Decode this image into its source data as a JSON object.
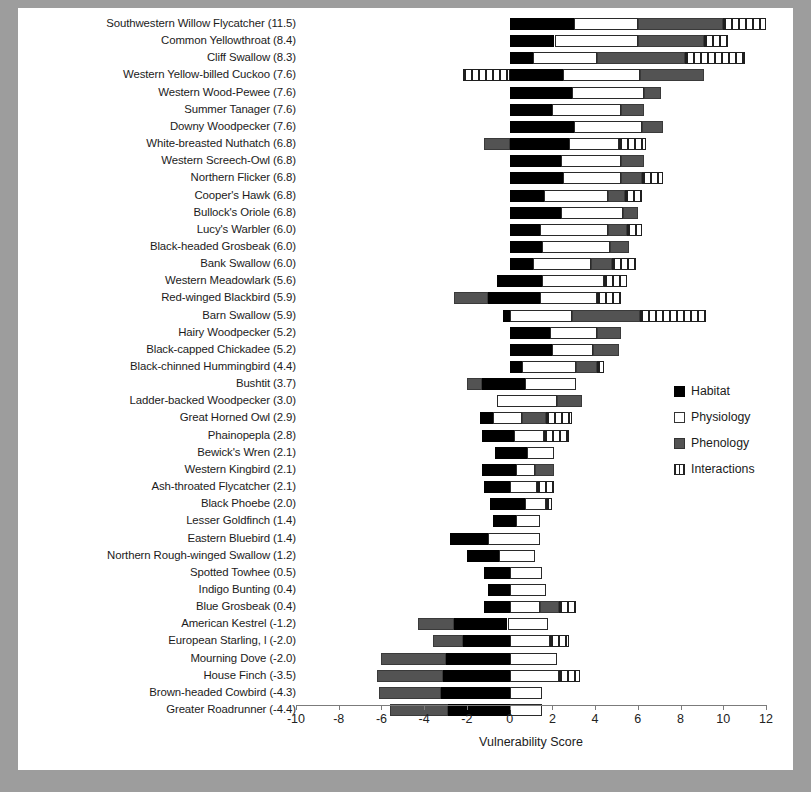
{
  "chart_data": {
    "type": "bar",
    "orientation": "horizontal",
    "stacked": true,
    "title": "",
    "xlabel": "Vulnerability Score",
    "ylabel": "",
    "xlim": [
      -10,
      12
    ],
    "xticks": [
      -10,
      -8,
      -6,
      -4,
      -2,
      0,
      2,
      4,
      6,
      8,
      10,
      12
    ],
    "xticklabels": [
      "-10",
      "-8",
      "-6",
      "-4",
      "-2",
      "0",
      "2",
      "4",
      "6",
      "8",
      "10",
      "12"
    ],
    "grid": false,
    "legend_position": "right",
    "legend": [
      {
        "name": "Habitat",
        "fill": "#000000",
        "style": "solid-black"
      },
      {
        "name": "Physiology",
        "fill": "#ffffff",
        "style": "open-white"
      },
      {
        "name": "Phenology",
        "fill": "#535353",
        "style": "solid-gray"
      },
      {
        "name": "Interactions",
        "fill": "#ffffff",
        "style": "vertical-hatch"
      }
    ],
    "series_order": [
      "Habitat",
      "Physiology",
      "Phenology",
      "Interactions"
    ],
    "categories": [
      "Southwestern Willow Flycatcher (11.5)",
      "Common Yellowthroat  (8.4)",
      "Cliff Swallow  (8.3)",
      "Western Yellow-billed Cuckoo  (7.6)",
      "Western Wood-Pewee  (7.6)",
      "Summer Tanager  (7.6)",
      "Downy Woodpecker  (7.6)",
      "White-breasted Nuthatch  (6.8)",
      "Western Screech-Owl  (6.8)",
      "Northern Flicker  (6.8)",
      "Cooper's Hawk  (6.8)",
      "Bullock's Oriole (6.8)",
      "Lucy's Warbler  (6.0)",
      "Black-headed Grosbeak  (6.0)",
      "Bank Swallow (6.0)",
      "Western Meadowlark (5.6)",
      "Red-winged Blackbird (5.9)",
      "Barn Swallow (5.9)",
      "Hairy Woodpecker (5.2)",
      "Black-capped Chickadee (5.2)",
      "Black-chinned Hummingbird (4.4)",
      "Bushtit (3.7)",
      "Ladder-backed Woodpecker (3.0)",
      "Great Horned Owl (2.9)",
      "Phainopepla (2.8)",
      "Bewick's Wren  (2.1)",
      "Western Kingbird  (2.1)",
      "Ash-throated Flycatcher (2.1)",
      "Black Phoebe (2.0)",
      "Lesser Goldfinch  (1.4)",
      "Eastern Bluebird (1.4)",
      "Northern Rough-winged Swallow (1.2)",
      "Spotted Towhee (0.5)",
      "Indigo Bunting  (0.4)",
      "Blue Grosbeak (0.4)",
      "American Kestrel (-1.2)",
      "European Starling, l (-2.0)",
      "Mourning Dove (-2.0)",
      "House Finch (-3.5)",
      "Brown-headed Cowbird (-4.3)",
      "Greater Roadrunner (-4.4)"
    ],
    "scores": [
      11.5,
      8.4,
      8.3,
      7.6,
      7.6,
      7.6,
      7.6,
      6.8,
      6.8,
      6.8,
      6.8,
      6.8,
      6.0,
      6.0,
      6.0,
      5.6,
      5.9,
      5.9,
      5.2,
      5.2,
      4.4,
      3.7,
      3.0,
      2.9,
      2.8,
      2.1,
      2.1,
      2.1,
      2.0,
      1.4,
      1.4,
      1.2,
      0.5,
      0.4,
      0.4,
      -1.2,
      -2.0,
      -2.0,
      -3.5,
      -4.3,
      -4.4
    ],
    "rows": [
      {
        "habitat": [
          0.0,
          3.0
        ],
        "physiology": [
          3.0,
          6.0
        ],
        "phenology": [
          6.0,
          10.0
        ],
        "interactions": [
          10.0,
          12.0
        ]
      },
      {
        "habitat": [
          0.0,
          2.1
        ],
        "physiology": [
          2.1,
          6.0
        ],
        "phenology": [
          6.0,
          9.1
        ],
        "interactions": [
          9.1,
          10.2
        ]
      },
      {
        "habitat": [
          0.0,
          1.1
        ],
        "physiology": [
          1.1,
          4.1
        ],
        "phenology": [
          4.1,
          8.2
        ],
        "interactions": [
          8.2,
          11.0
        ]
      },
      {
        "habitat": [
          0.0,
          2.5
        ],
        "physiology": [
          2.5,
          6.1
        ],
        "phenology": [
          6.1,
          9.1
        ],
        "interactions": [
          -2.2,
          0.0
        ]
      },
      {
        "habitat": [
          0.0,
          2.9
        ],
        "physiology": [
          2.9,
          6.3
        ],
        "phenology": [
          6.3,
          7.1
        ],
        "interactions": [
          7.1,
          7.1
        ]
      },
      {
        "habitat": [
          0.0,
          2.0
        ],
        "physiology": [
          2.0,
          5.2
        ],
        "phenology": [
          5.2,
          6.3
        ],
        "interactions": [
          6.3,
          6.3
        ]
      },
      {
        "habitat": [
          0.0,
          3.0
        ],
        "physiology": [
          3.0,
          6.2
        ],
        "phenology": [
          6.2,
          7.2
        ],
        "interactions": [
          7.2,
          7.2
        ]
      },
      {
        "habitat": [
          0.0,
          2.8
        ],
        "physiology": [
          2.8,
          5.1
        ],
        "phenology": [
          -1.2,
          0.0
        ],
        "interactions": [
          5.1,
          6.4
        ]
      },
      {
        "habitat": [
          0.0,
          2.4
        ],
        "physiology": [
          2.4,
          5.2
        ],
        "phenology": [
          5.2,
          6.3
        ],
        "interactions": [
          6.3,
          6.3
        ]
      },
      {
        "habitat": [
          0.0,
          2.5
        ],
        "physiology": [
          2.5,
          5.2
        ],
        "phenology": [
          5.2,
          6.2
        ],
        "interactions": [
          6.2,
          7.2
        ]
      },
      {
        "habitat": [
          0.0,
          1.6
        ],
        "physiology": [
          1.6,
          4.6
        ],
        "phenology": [
          4.6,
          5.4
        ],
        "interactions": [
          5.4,
          6.2
        ]
      },
      {
        "habitat": [
          0.0,
          2.4
        ],
        "physiology": [
          2.4,
          5.3
        ],
        "phenology": [
          5.3,
          6.0
        ],
        "interactions": [
          6.0,
          6.0
        ]
      },
      {
        "habitat": [
          0.0,
          1.4
        ],
        "physiology": [
          1.4,
          4.6
        ],
        "phenology": [
          4.6,
          5.5
        ],
        "interactions": [
          5.5,
          6.2
        ]
      },
      {
        "habitat": [
          0.0,
          1.5
        ],
        "physiology": [
          1.5,
          4.7
        ],
        "phenology": [
          4.7,
          5.6
        ],
        "interactions": [
          5.6,
          5.6
        ]
      },
      {
        "habitat": [
          0.0,
          1.1
        ],
        "physiology": [
          1.1,
          3.8
        ],
        "phenology": [
          3.8,
          4.8
        ],
        "interactions": [
          4.8,
          5.9
        ]
      },
      {
        "habitat": [
          -0.6,
          1.5
        ],
        "physiology": [
          1.5,
          4.4
        ],
        "phenology": [
          -0.6,
          -0.6
        ],
        "interactions": [
          4.4,
          5.5
        ]
      },
      {
        "habitat": [
          -1.0,
          1.4
        ],
        "physiology": [
          1.4,
          4.1
        ],
        "phenology": [
          -2.6,
          -1.0
        ],
        "interactions": [
          4.1,
          5.2
        ]
      },
      {
        "habitat": [
          -0.3,
          0.0
        ],
        "physiology": [
          0.0,
          2.9
        ],
        "phenology": [
          2.9,
          6.1
        ],
        "interactions": [
          6.1,
          9.2
        ]
      },
      {
        "habitat": [
          0.0,
          1.9
        ],
        "physiology": [
          1.9,
          4.1
        ],
        "phenology": [
          4.1,
          5.2
        ],
        "interactions": [
          5.2,
          5.2
        ]
      },
      {
        "habitat": [
          0.0,
          2.0
        ],
        "physiology": [
          2.0,
          3.9
        ],
        "phenology": [
          3.9,
          5.1
        ],
        "interactions": [
          5.1,
          5.1
        ]
      },
      {
        "habitat": [
          0.0,
          0.6
        ],
        "physiology": [
          0.6,
          3.1
        ],
        "phenology": [
          3.1,
          4.1
        ],
        "interactions": [
          4.1,
          4.4
        ]
      },
      {
        "habitat": [
          -1.3,
          0.7
        ],
        "physiology": [
          0.7,
          3.1
        ],
        "phenology": [
          -2.0,
          -1.3
        ],
        "interactions": [
          3.1,
          3.1
        ]
      },
      {
        "habitat": [
          0.0,
          0.0
        ],
        "physiology": [
          -0.6,
          2.2
        ],
        "phenology": [
          2.2,
          3.4
        ],
        "interactions": [
          3.4,
          3.4
        ]
      },
      {
        "habitat": [
          -1.4,
          -0.8
        ],
        "physiology": [
          -0.8,
          0.6
        ],
        "phenology": [
          0.6,
          1.7
        ],
        "interactions": [
          1.7,
          2.9
        ]
      },
      {
        "habitat": [
          -1.3,
          0.2
        ],
        "physiology": [
          0.2,
          1.6
        ],
        "phenology": [
          -1.3,
          -1.3
        ],
        "interactions": [
          1.6,
          2.8
        ]
      },
      {
        "habitat": [
          -0.7,
          0.8
        ],
        "physiology": [
          0.8,
          2.1
        ],
        "phenology": [
          -0.7,
          -0.7
        ],
        "interactions": [
          2.1,
          2.1
        ]
      },
      {
        "habitat": [
          -1.3,
          0.3
        ],
        "physiology": [
          0.3,
          1.2
        ],
        "phenology": [
          1.2,
          2.1
        ],
        "interactions": [
          2.1,
          2.1
        ]
      },
      {
        "habitat": [
          -1.2,
          0.0
        ],
        "physiology": [
          0.0,
          1.3
        ],
        "phenology": [
          -1.2,
          -1.2
        ],
        "interactions": [
          1.3,
          2.1
        ]
      },
      {
        "habitat": [
          -0.9,
          0.7
        ],
        "physiology": [
          0.7,
          1.7
        ],
        "phenology": [
          -0.9,
          -0.9
        ],
        "interactions": [
          1.7,
          2.0
        ]
      },
      {
        "habitat": [
          -0.8,
          0.3
        ],
        "physiology": [
          0.3,
          1.4
        ],
        "phenology": [
          -0.8,
          -0.8
        ],
        "interactions": [
          1.4,
          1.4
        ]
      },
      {
        "habitat": [
          -2.8,
          -1.0
        ],
        "physiology": [
          -1.0,
          1.4
        ],
        "phenology": [
          -2.8,
          -2.8
        ],
        "interactions": [
          1.4,
          1.4
        ]
      },
      {
        "habitat": [
          -2.0,
          -0.5
        ],
        "physiology": [
          -0.5,
          1.2
        ],
        "phenology": [
          -2.0,
          -2.0
        ],
        "interactions": [
          1.2,
          1.2
        ]
      },
      {
        "habitat": [
          -1.2,
          0.0
        ],
        "physiology": [
          0.0,
          1.5
        ],
        "phenology": [
          -1.2,
          -1.2
        ],
        "interactions": [
          1.5,
          1.5
        ]
      },
      {
        "habitat": [
          -1.0,
          0.0
        ],
        "physiology": [
          0.0,
          1.7
        ],
        "phenology": [
          -1.0,
          -1.0
        ],
        "interactions": [
          1.7,
          1.7
        ]
      },
      {
        "habitat": [
          -1.2,
          0.0
        ],
        "physiology": [
          0.0,
          1.4
        ],
        "phenology": [
          1.4,
          2.3
        ],
        "interactions": [
          2.3,
          3.1
        ]
      },
      {
        "habitat": [
          -2.6,
          -0.1
        ],
        "physiology": [
          -0.1,
          1.8
        ],
        "phenology": [
          -4.3,
          -2.6
        ],
        "interactions": [
          1.8,
          1.8
        ]
      },
      {
        "habitat": [
          -2.2,
          0.0
        ],
        "physiology": [
          0.0,
          1.9
        ],
        "phenology": [
          -3.6,
          -2.2
        ],
        "interactions": [
          1.9,
          2.8
        ]
      },
      {
        "habitat": [
          -3.0,
          0.0
        ],
        "physiology": [
          0.0,
          2.2
        ],
        "phenology": [
          -6.0,
          -3.0
        ],
        "interactions": [
          2.2,
          2.2
        ]
      },
      {
        "habitat": [
          -3.1,
          0.0
        ],
        "physiology": [
          0.0,
          2.3
        ],
        "phenology": [
          -6.2,
          -3.1
        ],
        "interactions": [
          2.3,
          3.3
        ]
      },
      {
        "habitat": [
          -3.2,
          0.0
        ],
        "physiology": [
          0.0,
          1.5
        ],
        "phenology": [
          -6.1,
          -3.2
        ],
        "interactions": [
          1.5,
          1.5
        ]
      },
      {
        "habitat": [
          -2.9,
          0.0
        ],
        "physiology": [
          0.0,
          1.5
        ],
        "phenology": [
          -5.6,
          -2.9
        ],
        "interactions": [
          1.5,
          1.5
        ]
      }
    ]
  }
}
